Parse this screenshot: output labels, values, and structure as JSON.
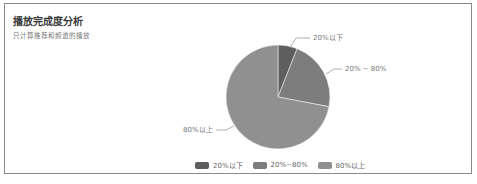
{
  "card": {
    "title": "播放完成度分析",
    "subtitle": "只计算推荐和频道的播放"
  },
  "chart_data": {
    "type": "pie",
    "title": "播放完成度分析",
    "subtitle": "只计算推荐和频道的播放",
    "categories": [
      "20%以下",
      "20% ~ 80%",
      "80%以上"
    ],
    "values": [
      6,
      22,
      72
    ],
    "colors": [
      "#5e5e5e",
      "#7d7d7d",
      "#909090"
    ],
    "legend": {
      "position": "bottom",
      "entries": [
        "20%以下",
        "20%~80%",
        "80%以上"
      ]
    },
    "slice_labels": [
      "20%以下",
      "20% ~ 80%",
      "80%以上"
    ]
  },
  "legend": {
    "items": [
      {
        "label": "20%以下",
        "color": "#5e5e5e"
      },
      {
        "label": "20%~80%",
        "color": "#7d7d7d"
      },
      {
        "label": "80%以上",
        "color": "#909090"
      }
    ]
  },
  "labels": {
    "slice0": "20%以下",
    "slice1": "20% ~ 80%",
    "slice2": "80%以上"
  }
}
